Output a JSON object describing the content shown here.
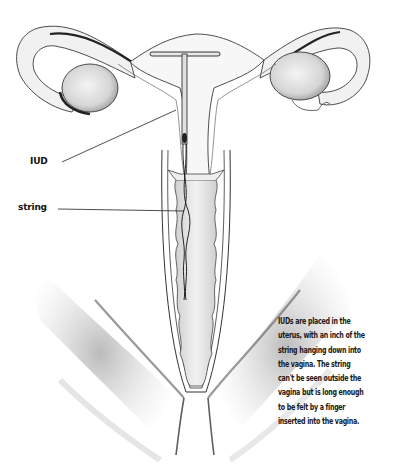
{
  "labels": {
    "iud": "IUD",
    "string": "string"
  },
  "caption": {
    "lines": [
      "IUDs are placed in the",
      "uterus, with an inch of the",
      "string hanging down into",
      "the vagina. The string",
      "can't be seen outside the",
      "vagina but is long enough",
      "to be felt by a finger",
      "inserted into the vagina."
    ]
  },
  "colors": {
    "line": "#3a3a3a",
    "shade": "#8a8a8a",
    "text": "#1a1a1a",
    "background": "#ffffff"
  }
}
